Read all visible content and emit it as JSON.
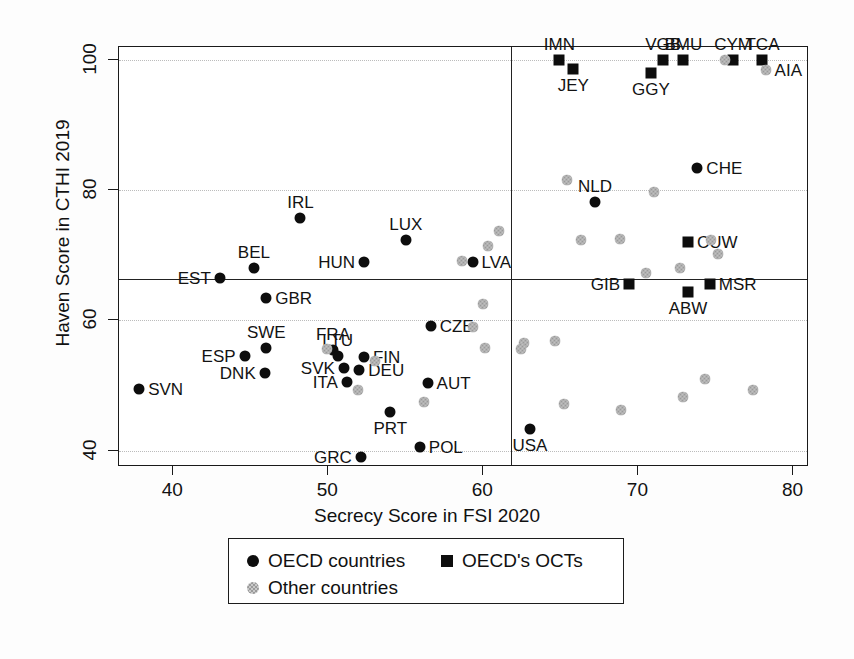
{
  "chart_data": {
    "type": "scatter",
    "title": "",
    "xlabel": "Secrecy Score in FSI 2020",
    "ylabel": "Haven Score in CTHI 2019",
    "xlim": [
      36.5,
      81.0
    ],
    "ylim": [
      37.5,
      102.0
    ],
    "xticks": [
      40,
      50,
      60,
      70,
      80
    ],
    "yticks": [
      40,
      60,
      80,
      100
    ],
    "grid": "horizontal-dotted",
    "legend_position": "below-plot",
    "reference_lines": {
      "vertical_x": 61.8,
      "horizontal_y": 66.4
    },
    "legend": [
      {
        "label": "OECD countries",
        "marker": "circle",
        "color": "#0d0d0d"
      },
      {
        "label": "OECD's OCTs",
        "marker": "square",
        "color": "#0d0d0d"
      },
      {
        "label": "Other countries",
        "marker": "circle-hatched",
        "color": "#9a9a9a"
      }
    ],
    "series": [
      {
        "name": "OECD countries",
        "marker": "circle",
        "points": [
          {
            "label": "SVN",
            "x": 37.8,
            "y": 49.5,
            "label_pos": "right"
          },
          {
            "label": "EST",
            "x": 43.0,
            "y": 66.5,
            "label_pos": "left"
          },
          {
            "label": "BEL",
            "x": 45.2,
            "y": 68.0,
            "label_pos": "above"
          },
          {
            "label": "ESP",
            "x": 44.6,
            "y": 54.5,
            "label_pos": "left"
          },
          {
            "label": "SWE",
            "x": 46.0,
            "y": 55.8,
            "label_pos": "above"
          },
          {
            "label": "DNK",
            "x": 45.9,
            "y": 52.0,
            "label_pos": "left"
          },
          {
            "label": "GBR",
            "x": 46.0,
            "y": 63.5,
            "label_pos": "right"
          },
          {
            "label": "IRL",
            "x": 48.2,
            "y": 75.8,
            "label_pos": "above"
          },
          {
            "label": "FRA",
            "x": 50.3,
            "y": 55.5,
            "label_pos": "above"
          },
          {
            "label": "LTU",
            "x": 50.6,
            "y": 54.6,
            "label_pos": "above"
          },
          {
            "label": "SVK",
            "x": 51.0,
            "y": 52.7,
            "label_pos": "left"
          },
          {
            "label": "ITA",
            "x": 51.2,
            "y": 50.5,
            "label_pos": "left"
          },
          {
            "label": "DEU",
            "x": 52.0,
            "y": 52.4,
            "label_pos": "right"
          },
          {
            "label": "FIN",
            "x": 52.3,
            "y": 54.4,
            "label_pos": "right"
          },
          {
            "label": "HUN",
            "x": 52.3,
            "y": 69.0,
            "label_pos": "left"
          },
          {
            "label": "LUX",
            "x": 55.0,
            "y": 72.3,
            "label_pos": "above"
          },
          {
            "label": "PRT",
            "x": 54.0,
            "y": 46.0,
            "label_pos": "below"
          },
          {
            "label": "GRC",
            "x": 52.1,
            "y": 39.0,
            "label_pos": "left"
          },
          {
            "label": "POL",
            "x": 55.9,
            "y": 40.6,
            "label_pos": "right"
          },
          {
            "label": "CZE",
            "x": 56.6,
            "y": 59.2,
            "label_pos": "right"
          },
          {
            "label": "AUT",
            "x": 56.4,
            "y": 50.4,
            "label_pos": "right"
          },
          {
            "label": "LVA",
            "x": 59.3,
            "y": 69.0,
            "label_pos": "right"
          },
          {
            "label": "USA",
            "x": 63.0,
            "y": 43.4,
            "label_pos": "below"
          },
          {
            "label": "NLD",
            "x": 67.2,
            "y": 78.2,
            "label_pos": "above"
          },
          {
            "label": "CHE",
            "x": 73.8,
            "y": 83.4,
            "label_pos": "right"
          }
        ]
      },
      {
        "name": "OECD's OCTs",
        "marker": "square",
        "points": [
          {
            "label": "IMN",
            "x": 64.9,
            "y": 100.0,
            "label_pos": "above"
          },
          {
            "label": "JEY",
            "x": 65.8,
            "y": 98.6,
            "label_pos": "below"
          },
          {
            "label": "VGB",
            "x": 71.6,
            "y": 100.0,
            "label_pos": "above"
          },
          {
            "label": "GGY",
            "x": 70.8,
            "y": 98.0,
            "label_pos": "below"
          },
          {
            "label": "BMU",
            "x": 72.9,
            "y": 100.0,
            "label_pos": "above"
          },
          {
            "label": "CYM",
            "x": 76.1,
            "y": 100.0,
            "label_pos": "above"
          },
          {
            "label": "TCA",
            "x": 78.0,
            "y": 100.0,
            "label_pos": "above"
          },
          {
            "label": "CUW",
            "x": 73.2,
            "y": 72.0,
            "label_pos": "right"
          },
          {
            "label": "GIB",
            "x": 69.4,
            "y": 65.6,
            "label_pos": "left"
          },
          {
            "label": "ABW",
            "x": 73.2,
            "y": 64.4,
            "label_pos": "below"
          },
          {
            "label": "MSR",
            "x": 74.6,
            "y": 65.6,
            "label_pos": "right"
          }
        ]
      },
      {
        "name": "Other countries",
        "marker": "circle-hatched",
        "points": [
          {
            "label": "AIA",
            "x": 78.2,
            "y": 98.4,
            "label_pos": "right"
          },
          {
            "label": "",
            "x": 75.6,
            "y": 100.0,
            "label_pos": "none"
          },
          {
            "label": "",
            "x": 65.4,
            "y": 81.6,
            "label_pos": "none"
          },
          {
            "label": "",
            "x": 71.0,
            "y": 79.8,
            "label_pos": "none"
          },
          {
            "label": "",
            "x": 74.7,
            "y": 72.3,
            "label_pos": "none"
          },
          {
            "label": "",
            "x": 75.1,
            "y": 70.2,
            "label_pos": "none"
          },
          {
            "label": "",
            "x": 72.7,
            "y": 68.0,
            "label_pos": "none"
          },
          {
            "label": "",
            "x": 66.3,
            "y": 72.4,
            "label_pos": "none"
          },
          {
            "label": "",
            "x": 68.8,
            "y": 72.5,
            "label_pos": "none"
          },
          {
            "label": "",
            "x": 70.5,
            "y": 67.3,
            "label_pos": "none"
          },
          {
            "label": "",
            "x": 61.0,
            "y": 73.8,
            "label_pos": "none"
          },
          {
            "label": "",
            "x": 60.3,
            "y": 71.5,
            "label_pos": "none"
          },
          {
            "label": "",
            "x": 58.6,
            "y": 69.2,
            "label_pos": "none"
          },
          {
            "label": "",
            "x": 60.0,
            "y": 62.5,
            "label_pos": "none"
          },
          {
            "label": "",
            "x": 59.3,
            "y": 59.0,
            "label_pos": "none"
          },
          {
            "label": "",
            "x": 60.1,
            "y": 55.7,
            "label_pos": "none"
          },
          {
            "label": "",
            "x": 49.9,
            "y": 55.6,
            "label_pos": "none"
          },
          {
            "label": "",
            "x": 53.0,
            "y": 53.8,
            "label_pos": "none"
          },
          {
            "label": "",
            "x": 51.9,
            "y": 49.3,
            "label_pos": "none"
          },
          {
            "label": "",
            "x": 56.2,
            "y": 47.5,
            "label_pos": "none"
          },
          {
            "label": "",
            "x": 62.6,
            "y": 56.5,
            "label_pos": "none"
          },
          {
            "label": "",
            "x": 62.4,
            "y": 55.6,
            "label_pos": "none"
          },
          {
            "label": "",
            "x": 64.6,
            "y": 56.9,
            "label_pos": "none"
          },
          {
            "label": "",
            "x": 65.2,
            "y": 47.2,
            "label_pos": "none"
          },
          {
            "label": "",
            "x": 68.9,
            "y": 46.3,
            "label_pos": "none"
          },
          {
            "label": "",
            "x": 72.9,
            "y": 48.3,
            "label_pos": "none"
          },
          {
            "label": "",
            "x": 74.3,
            "y": 51.0,
            "label_pos": "none"
          },
          {
            "label": "",
            "x": 77.4,
            "y": 49.3,
            "label_pos": "none"
          }
        ]
      }
    ]
  }
}
